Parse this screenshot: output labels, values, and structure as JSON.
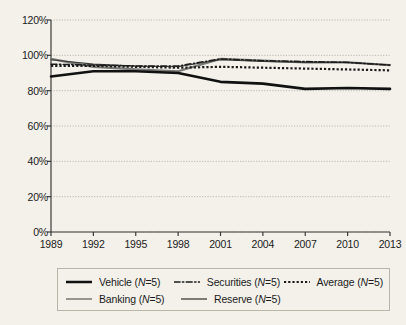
{
  "chart_data": {
    "type": "line",
    "title": "",
    "xlabel": "",
    "ylabel": "",
    "x": [
      1989,
      1992,
      1995,
      1998,
      2001,
      2004,
      2007,
      2010,
      2013
    ],
    "categories": [
      "1989",
      "1992",
      "1995",
      "1998",
      "2001",
      "2004",
      "2007",
      "2010",
      "2013"
    ],
    "ylim": [
      0,
      120
    ],
    "ytick_values": [
      0,
      20,
      40,
      60,
      80,
      100,
      120
    ],
    "ytick_labels": [
      "0%",
      "20%",
      "40%",
      "60%",
      "80%",
      "100%",
      "120%"
    ],
    "grid": true,
    "grid_axis": "y",
    "legend_position": "bottom",
    "series": [
      {
        "name": "Vehicle (N=5)",
        "label_text": "Vehicle (",
        "label_italic": "N",
        "label_tail": "=5)",
        "style": "solid-thick",
        "color": "#111111",
        "width": 2.6,
        "values": [
          88,
          91,
          91,
          90,
          85,
          84,
          81,
          81.5,
          81
        ]
      },
      {
        "name": "Securities (N=5)",
        "label_text": "Securities (",
        "label_italic": "N",
        "label_tail": "=5)",
        "style": "dash-dot",
        "color": "#1b1b1b",
        "width": 1.5,
        "values": [
          95,
          94.5,
          94,
          94,
          98,
          97,
          96.5,
          96,
          94.5
        ]
      },
      {
        "name": "Average (N=5)",
        "label_text": "Average (",
        "label_italic": "N",
        "label_tail": "=5)",
        "style": "dotted",
        "color": "#1b1b1b",
        "width": 2.2,
        "values": [
          94,
          94,
          93.5,
          93,
          93.5,
          93,
          92.5,
          92,
          91.5
        ]
      },
      {
        "name": "Banking (N=5)",
        "label_text": "Banking (",
        "label_italic": "N",
        "label_tail": "=5)",
        "style": "solid-thin",
        "color": "#3a3a38",
        "width": 1.1,
        "values": [
          97.5,
          95,
          94,
          93.5,
          97.5,
          96.5,
          96,
          96,
          94.5
        ]
      },
      {
        "name": "Reserve (N=5)",
        "label_text": "Reserve (",
        "label_italic": "N",
        "label_tail": "=5)",
        "style": "solid-gray",
        "color": "#7b7b78",
        "width": 2.2,
        "values": [
          98,
          93.5,
          92,
          91,
          98,
          97,
          96,
          96,
          94.5
        ]
      }
    ]
  },
  "legend": {
    "rows": [
      [
        "Vehicle (N=5)",
        "Securities (N=5)",
        "Average (N=5)"
      ],
      [
        "Banking (N=5)",
        "Reserve (N=5)"
      ]
    ]
  }
}
